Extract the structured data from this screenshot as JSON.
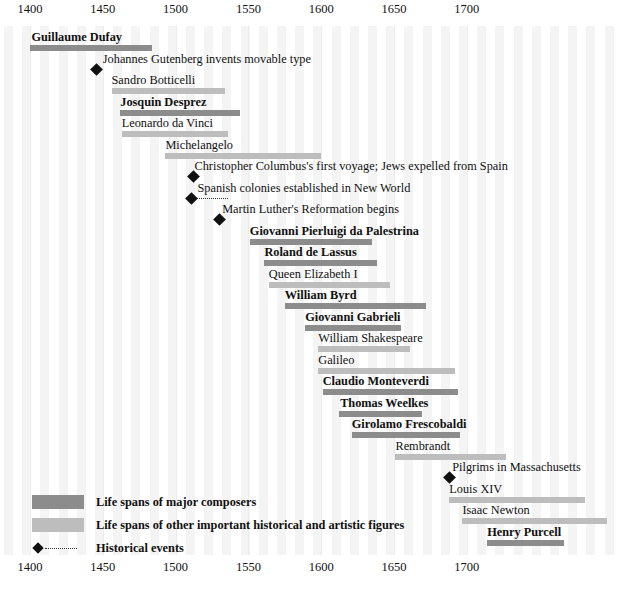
{
  "chart_data": {
    "type": "timeline",
    "title": "",
    "xlabel": "",
    "ylabel": "",
    "xlim": [
      1395,
      1715
    ],
    "grid": true,
    "legend_position": "bottom-left",
    "axis": {
      "ticks": [
        1400,
        1450,
        1500,
        1550,
        1600,
        1650,
        1700
      ],
      "tick_labels": [
        "1400",
        "1450",
        "1500",
        "1550",
        "1600",
        "1650",
        "1700"
      ],
      "top_axis": true,
      "bottom_axis": true
    },
    "colors": {
      "composer_bar": "#8c8c8c",
      "figure_bar": "#bdbdbd",
      "event_marker": "#111111",
      "background": "#ffffff",
      "gridband": "#f4f4f4"
    },
    "categories": [
      "Guillaume Dufay",
      "Johannes Gutenberg invents movable type",
      "Sandro Botticelli",
      "Josquin Desprez",
      "Leonardo da Vinci",
      "Michelangelo",
      "Christopher Columbus's first voyage; Jews expelled from Spain",
      "Spanish colonies established in New World",
      "Martin Luther's Reformation begins",
      "Giovanni Pierluigi da Palestrina",
      "Roland de Lassus",
      "Queen Elizabeth I",
      "William Byrd",
      "Giovanni Gabrieli",
      "William Shakespeare",
      "Galileo",
      "Claudio Monteverdi",
      "Thomas Weelkes",
      "Girolamo Frescobaldi",
      "Rembrandt",
      "Pilgrims in Massachusetts",
      "Louis XIV",
      "Isaac Newton",
      "Henry Purcell"
    ],
    "rows": [
      {
        "label": "Guillaume Dufay",
        "kind": "composer",
        "start": 1400,
        "end": 1484,
        "label_x": 1401,
        "row": 0
      },
      {
        "label": "Johannes Gutenberg invents movable type",
        "kind": "event",
        "year": 1446,
        "label_x": 1450,
        "row": 1
      },
      {
        "label": "Sandro Botticelli",
        "kind": "figure",
        "start": 1456,
        "end": 1534,
        "label_x": 1456,
        "row": 2
      },
      {
        "label": "Josquin Desprez",
        "kind": "composer",
        "start": 1462,
        "end": 1544,
        "label_x": 1462,
        "row": 3
      },
      {
        "label": "Leonardo da Vinci",
        "kind": "figure",
        "start": 1463,
        "end": 1536,
        "label_x": 1463,
        "row": 4
      },
      {
        "label": "Michelangelo",
        "kind": "figure",
        "start": 1493,
        "end": 1600,
        "label_x": 1493,
        "row": 5
      },
      {
        "label": "Christopher Columbus's first voyage; Jews expelled from Spain",
        "kind": "event",
        "year": 1512,
        "label_x": 1513,
        "row": 6
      },
      {
        "label": "Spanish colonies established in New World",
        "kind": "event",
        "year": 1511,
        "label_x": 1515,
        "row": 7,
        "dots_to": 1536
      },
      {
        "label": "Martin Luther's Reformation begins",
        "kind": "event",
        "year": 1530,
        "label_x": 1532,
        "row": 8
      },
      {
        "label": "Giovanni Pierluigi da Palestrina",
        "kind": "composer",
        "start": 1551,
        "end": 1635,
        "label_x": 1551,
        "row": 9
      },
      {
        "label": "Roland de Lassus",
        "kind": "composer",
        "start": 1561,
        "end": 1638,
        "label_x": 1561,
        "row": 10
      },
      {
        "label": "Queen Elizabeth I",
        "kind": "figure",
        "start": 1564,
        "end": 1647,
        "label_x": 1564,
        "row": 11
      },
      {
        "label": "William Byrd",
        "kind": "composer",
        "start": 1575,
        "end": 1672,
        "label_x": 1575,
        "row": 12
      },
      {
        "label": "Giovanni Gabrieli",
        "kind": "composer",
        "start": 1589,
        "end": 1655,
        "label_x": 1589,
        "row": 13
      },
      {
        "label": "William Shakespeare",
        "kind": "figure",
        "start": 1598,
        "end": 1661,
        "label_x": 1598,
        "row": 14
      },
      {
        "label": "Galileo",
        "kind": "figure",
        "start": 1598,
        "end": 1692,
        "label_x": 1598,
        "row": 15
      },
      {
        "label": "Claudio Monteverdi",
        "kind": "composer",
        "start": 1601,
        "end": 1694,
        "label_x": 1601,
        "row": 16
      },
      {
        "label": "Thomas Weelkes",
        "kind": "composer",
        "start": 1612,
        "end": 1669,
        "label_x": 1613,
        "row": 17
      },
      {
        "label": "Girolamo Frescobaldi",
        "kind": "composer",
        "start": 1621,
        "end": 1695,
        "label_x": 1621,
        "row": 18
      },
      {
        "label": "Rembrandt",
        "kind": "figure",
        "start": 1651,
        "end": 1727,
        "label_x": 1651,
        "row": 19
      },
      {
        "label": "Pilgrims in Massachusetts",
        "kind": "event",
        "year": 1688,
        "label_x": 1690,
        "row": 20
      },
      {
        "label": "Louis XIV",
        "kind": "figure",
        "start": 1688,
        "end": 1781,
        "label_x": 1688,
        "row": 21
      },
      {
        "label": "Isaac Newton",
        "kind": "figure",
        "start": 1697,
        "end": 1796,
        "label_x": 1697,
        "row": 22
      },
      {
        "label": "Henry Purcell",
        "kind": "composer",
        "start": 1714,
        "end": 1767,
        "label_x": 1714,
        "row": 23
      }
    ]
  },
  "legend": {
    "items": [
      {
        "swatch": "composer",
        "label": "Life spans of major composers"
      },
      {
        "swatch": "figure",
        "label": "Life spans of other important historical and artistic figures"
      },
      {
        "swatch": "event",
        "label": "Historical events"
      }
    ]
  }
}
